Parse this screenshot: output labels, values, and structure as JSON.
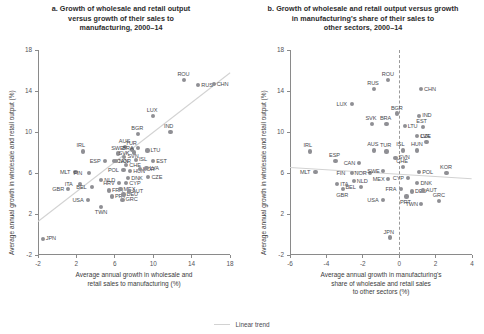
{
  "legend": {
    "label": "Linear trend",
    "color": "#d2d2d2"
  },
  "chart_data": [
    {
      "type": "scatter",
      "panel": "a",
      "title": "a. Growth of wholesale and retail output versus growth of their sales to manufacturing, 2000–14",
      "title_lines": [
        "a. Growth of wholesale and retail output",
        "versus growth of their sales to",
        "manufacturing, 2000–14"
      ],
      "xlabel_lines": [
        "Average annual growth in wholesale and",
        "retail sales to manufacturing (%)"
      ],
      "ylabel_lines": [
        "Average annual growth in wholesale and retail output (%)"
      ],
      "xlim": [
        -2,
        18
      ],
      "ylim": [
        -2,
        18
      ],
      "xticks": [
        -2,
        2,
        6,
        10,
        14,
        18
      ],
      "yticks": [
        -2,
        2,
        6,
        10,
        14,
        18
      ],
      "grid": false,
      "legend_position": "bottom-center",
      "trend": {
        "x0": -2.0,
        "y0": 1.3,
        "x1": 18.0,
        "y1": 15.8
      },
      "points": [
        {
          "label": "JPN",
          "x": -1.5,
          "y": -0.4,
          "lp": "right"
        },
        {
          "label": "GBR",
          "x": 1.1,
          "y": 4.4,
          "lp": "left"
        },
        {
          "label": "USA",
          "x": 3.2,
          "y": 3.4,
          "lp": "left"
        },
        {
          "label": "TWN",
          "x": 4.6,
          "y": 2.7,
          "lp": "below"
        },
        {
          "label": "ITA",
          "x": 2.4,
          "y": 4.9,
          "lp": "left"
        },
        {
          "label": "MLT",
          "x": 1.9,
          "y": 6.1,
          "lp": "left"
        },
        {
          "label": "FIN",
          "x": 3.3,
          "y": 6.0,
          "lp": "left"
        },
        {
          "label": "IRL",
          "x": 2.7,
          "y": 8.1,
          "lp": "above"
        },
        {
          "label": "BEL",
          "x": 3.6,
          "y": 4.6,
          "lp": "left"
        },
        {
          "label": "NLD",
          "x": 4.6,
          "y": 5.3,
          "lp": "right"
        },
        {
          "label": "ESP",
          "x": 5.0,
          "y": 7.2,
          "lp": "left"
        },
        {
          "label": "CAN",
          "x": 5.9,
          "y": 7.2,
          "lp": "right"
        },
        {
          "label": "FRA",
          "x": 5.4,
          "y": 4.3,
          "lp": "right"
        },
        {
          "label": "PRT",
          "x": 5.7,
          "y": 3.7,
          "lp": "right"
        },
        {
          "label": "GRC",
          "x": 6.8,
          "y": 3.4,
          "lp": "right"
        },
        {
          "label": "HRV",
          "x": 6.4,
          "y": 5.0,
          "lp": "left"
        },
        {
          "label": "MEX",
          "x": 6.6,
          "y": 4.4,
          "lp": "right"
        },
        {
          "label": "DEU",
          "x": 6.9,
          "y": 3.9,
          "lp": "right"
        },
        {
          "label": "AUT",
          "x": 7.5,
          "y": 4.2,
          "lp": "right"
        },
        {
          "label": "CYP",
          "x": 7.2,
          "y": 5.0,
          "lp": "right"
        },
        {
          "label": "DNK",
          "x": 7.4,
          "y": 5.5,
          "lp": "right"
        },
        {
          "label": "POL",
          "x": 6.9,
          "y": 6.3,
          "lp": "left"
        },
        {
          "label": "HUN",
          "x": 7.6,
          "y": 6.2,
          "lp": "right"
        },
        {
          "label": "NOR",
          "x": 6.1,
          "y": 7.2,
          "lp": "right"
        },
        {
          "label": "SWE",
          "x": 6.3,
          "y": 7.9,
          "lp": "above"
        },
        {
          "label": "SVN",
          "x": 7.0,
          "y": 7.6,
          "lp": "right"
        },
        {
          "label": "CHE",
          "x": 7.2,
          "y": 6.8,
          "lp": "right"
        },
        {
          "label": "TUR",
          "x": 7.8,
          "y": 8.3,
          "lp": "above"
        },
        {
          "label": "AUS",
          "x": 7.1,
          "y": 8.5,
          "lp": "above"
        },
        {
          "label": "ISL",
          "x": 8.2,
          "y": 7.3,
          "lp": "right"
        },
        {
          "label": "KOR",
          "x": 8.6,
          "y": 6.4,
          "lp": "right"
        },
        {
          "label": "CZE",
          "x": 9.5,
          "y": 5.6,
          "lp": "right"
        },
        {
          "label": "LVA",
          "x": 9.3,
          "y": 6.5,
          "lp": "right"
        },
        {
          "label": "EST",
          "x": 10.0,
          "y": 7.2,
          "lp": "right"
        },
        {
          "label": "LTU",
          "x": 9.4,
          "y": 8.2,
          "lp": "right"
        },
        {
          "label": "BRA",
          "x": 8.4,
          "y": 8.4,
          "lp": "left"
        },
        {
          "label": "SVK",
          "x": 8.0,
          "y": 8.0,
          "lp": "left"
        },
        {
          "label": "BGR",
          "x": 8.4,
          "y": 9.8,
          "lp": "above"
        },
        {
          "label": "LUX",
          "x": 10.0,
          "y": 11.6,
          "lp": "above"
        },
        {
          "label": "IND",
          "x": 11.8,
          "y": 10.0,
          "lp": "above"
        },
        {
          "label": "ROU",
          "x": 13.2,
          "y": 15.1,
          "lp": "above"
        },
        {
          "label": "RUS",
          "x": 14.7,
          "y": 14.6,
          "lp": "right"
        },
        {
          "label": "CHN",
          "x": 16.3,
          "y": 14.7,
          "lp": "right"
        }
      ]
    },
    {
      "type": "scatter",
      "panel": "b",
      "title": "b. Growth of wholesale and retail output versus growth in manufacturing's share of their sales to other sectors, 2000–14",
      "title_lines": [
        "b. Growth of wholesale and retail output versus growth",
        "in manufacturing's share of their sales to",
        "other sectors, 2000–14"
      ],
      "xlabel_lines": [
        "Average annual growth in manufacturing's",
        "share of wholesale and retail sales",
        "to other sectors (%)"
      ],
      "ylabel_lines": [
        "Average annual growth in wholesale and retail output (%)"
      ],
      "xlim": [
        -6,
        4
      ],
      "ylim": [
        -2,
        18
      ],
      "xticks": [
        -6,
        -4,
        -2,
        0,
        2,
        4
      ],
      "yticks": [
        -2,
        2,
        6,
        10,
        14,
        18
      ],
      "grid": false,
      "zero_reference_line": 0,
      "legend_position": "bottom-center",
      "trend": {
        "x0": -6.0,
        "y0": 6.6,
        "x1": 4.0,
        "y1": 5.5
      },
      "points": [
        {
          "label": "JPN",
          "x": -0.5,
          "y": -0.3,
          "lp": "above"
        },
        {
          "label": "GBR",
          "x": -3.1,
          "y": 4.4,
          "lp": "below"
        },
        {
          "label": "ITA",
          "x": -3.4,
          "y": 4.9,
          "lp": "right"
        },
        {
          "label": "USA",
          "x": -0.9,
          "y": 3.4,
          "lp": "left"
        },
        {
          "label": "TWN",
          "x": 1.2,
          "y": 3.0,
          "lp": "left"
        },
        {
          "label": "GRC",
          "x": 2.2,
          "y": 3.3,
          "lp": "above"
        },
        {
          "label": "MLT",
          "x": -4.6,
          "y": 6.1,
          "lp": "left"
        },
        {
          "label": "FIN",
          "x": -2.6,
          "y": 6.0,
          "lp": "left"
        },
        {
          "label": "NLD",
          "x": -2.5,
          "y": 5.2,
          "lp": "right"
        },
        {
          "label": "BEL",
          "x": -2.1,
          "y": 4.6,
          "lp": "left"
        },
        {
          "label": "NOR",
          "x": -1.6,
          "y": 6.0,
          "lp": "left"
        },
        {
          "label": "IRL",
          "x": -4.9,
          "y": 8.1,
          "lp": "above"
        },
        {
          "label": "ESP",
          "x": -3.5,
          "y": 7.2,
          "lp": "above"
        },
        {
          "label": "CAN",
          "x": -2.2,
          "y": 7.0,
          "lp": "left"
        },
        {
          "label": "AUS",
          "x": -1.4,
          "y": 8.2,
          "lp": "above"
        },
        {
          "label": "SWE",
          "x": -0.9,
          "y": 6.2,
          "lp": "left"
        },
        {
          "label": "MEX",
          "x": -0.6,
          "y": 5.4,
          "lp": "left"
        },
        {
          "label": "FRA",
          "x": 0.1,
          "y": 4.4,
          "lp": "left"
        },
        {
          "label": "PRT",
          "x": 0.4,
          "y": 3.7,
          "lp": "below"
        },
        {
          "label": "DEU",
          "x": 0.7,
          "y": 4.2,
          "lp": "right"
        },
        {
          "label": "AUT",
          "x": 1.3,
          "y": 4.3,
          "lp": "right"
        },
        {
          "label": "DNK",
          "x": 1.0,
          "y": 5.0,
          "lp": "right"
        },
        {
          "label": "CYP",
          "x": 0.5,
          "y": 5.5,
          "lp": "left"
        },
        {
          "label": "POL",
          "x": 1.1,
          "y": 6.1,
          "lp": "right"
        },
        {
          "label": "KOR",
          "x": 2.6,
          "y": 6.0,
          "lp": "above"
        },
        {
          "label": "CHE",
          "x": 0.2,
          "y": 6.6,
          "lp": "above"
        },
        {
          "label": "TUR",
          "x": -0.7,
          "y": 8.1,
          "lp": "above"
        },
        {
          "label": "SVN",
          "x": -0.2,
          "y": 7.5,
          "lp": "right"
        },
        {
          "label": "ISL",
          "x": 0.2,
          "y": 8.2,
          "lp": "above"
        },
        {
          "label": "HUN",
          "x": 1.0,
          "y": 8.2,
          "lp": "above"
        },
        {
          "label": "CZE",
          "x": 1.5,
          "y": 9.0,
          "lp": "above"
        },
        {
          "label": "LVA",
          "x": 1.0,
          "y": 9.6,
          "lp": "right"
        },
        {
          "label": "EST",
          "x": 1.3,
          "y": 10.5,
          "lp": "above"
        },
        {
          "label": "LTU",
          "x": 0.3,
          "y": 10.6,
          "lp": "right"
        },
        {
          "label": "BRA",
          "x": -0.7,
          "y": 10.8,
          "lp": "above"
        },
        {
          "label": "SVK",
          "x": -1.5,
          "y": 10.8,
          "lp": "above"
        },
        {
          "label": "BGR",
          "x": -0.1,
          "y": 11.8,
          "lp": "above"
        },
        {
          "label": "IND",
          "x": 1.1,
          "y": 11.6,
          "lp": "right"
        },
        {
          "label": "LUX",
          "x": -2.6,
          "y": 12.7,
          "lp": "left"
        },
        {
          "label": "RUS",
          "x": -1.4,
          "y": 14.2,
          "lp": "above"
        },
        {
          "label": "ROU",
          "x": -0.6,
          "y": 15.1,
          "lp": "above"
        },
        {
          "label": "CHN",
          "x": 1.2,
          "y": 14.2,
          "lp": "right"
        }
      ]
    }
  ]
}
